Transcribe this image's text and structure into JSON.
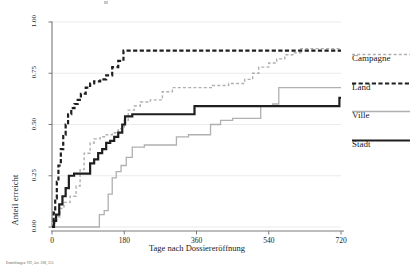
{
  "figure": {
    "footnote": "Ermittlungen VII, Art. 308, 315"
  },
  "chart_data": {
    "type": "line",
    "subtype": "step",
    "title": "",
    "xlabel": "Tage nach Dossiereröffnung",
    "ylabel": "Anteil erreicht",
    "xlim": [
      0,
      720
    ],
    "ylim": [
      0,
      1
    ],
    "xticks": [
      0,
      180,
      360,
      540,
      720
    ],
    "xticklabels": [
      "0",
      "180",
      "360",
      "540",
      "720"
    ],
    "yticks": [
      0.0,
      0.25,
      0.5,
      0.75,
      1.0
    ],
    "yticklabels": [
      "0.00",
      "0.25",
      "0.50",
      "0.75",
      "1.00"
    ],
    "grid": "horizontal",
    "legend_position": "right",
    "series": [
      {
        "name": "Campagne",
        "color": "#b0b0b0",
        "style": "dashed",
        "width": 1.4,
        "points": [
          [
            0,
            0.0
          ],
          [
            6,
            0.02
          ],
          [
            12,
            0.05
          ],
          [
            20,
            0.09
          ],
          [
            30,
            0.12
          ],
          [
            45,
            0.15
          ],
          [
            60,
            0.2
          ],
          [
            70,
            0.28
          ],
          [
            80,
            0.36
          ],
          [
            95,
            0.41
          ],
          [
            105,
            0.43
          ],
          [
            120,
            0.44
          ],
          [
            135,
            0.45
          ],
          [
            150,
            0.46
          ],
          [
            165,
            0.48
          ],
          [
            180,
            0.52
          ],
          [
            190,
            0.57
          ],
          [
            205,
            0.59
          ],
          [
            220,
            0.61
          ],
          [
            245,
            0.62
          ],
          [
            275,
            0.66
          ],
          [
            300,
            0.68
          ],
          [
            330,
            0.68
          ],
          [
            360,
            0.68
          ],
          [
            400,
            0.69
          ],
          [
            440,
            0.7
          ],
          [
            480,
            0.72
          ],
          [
            500,
            0.75
          ],
          [
            515,
            0.78
          ],
          [
            540,
            0.8
          ],
          [
            560,
            0.82
          ],
          [
            580,
            0.84
          ],
          [
            600,
            0.85
          ],
          [
            620,
            0.87
          ],
          [
            660,
            0.87
          ],
          [
            700,
            0.87
          ],
          [
            720,
            0.87
          ]
        ]
      },
      {
        "name": "Land",
        "color": "#1f1f1f",
        "style": "dashed",
        "width": 2.2,
        "points": [
          [
            0,
            0.0
          ],
          [
            4,
            0.07
          ],
          [
            8,
            0.14
          ],
          [
            12,
            0.22
          ],
          [
            16,
            0.3
          ],
          [
            22,
            0.38
          ],
          [
            28,
            0.45
          ],
          [
            34,
            0.5
          ],
          [
            40,
            0.55
          ],
          [
            48,
            0.58
          ],
          [
            56,
            0.6
          ],
          [
            64,
            0.62
          ],
          [
            72,
            0.65
          ],
          [
            84,
            0.68
          ],
          [
            95,
            0.7
          ],
          [
            105,
            0.71
          ],
          [
            120,
            0.72
          ],
          [
            135,
            0.74
          ],
          [
            150,
            0.78
          ],
          [
            165,
            0.81
          ],
          [
            178,
            0.86
          ],
          [
            200,
            0.86
          ],
          [
            260,
            0.86
          ],
          [
            320,
            0.86
          ],
          [
            380,
            0.86
          ],
          [
            440,
            0.86
          ],
          [
            500,
            0.86
          ],
          [
            560,
            0.86
          ],
          [
            620,
            0.86
          ],
          [
            680,
            0.86
          ],
          [
            720,
            0.86
          ]
        ]
      },
      {
        "name": "Ville",
        "color": "#b0b0b0",
        "style": "solid",
        "width": 1.3,
        "points": [
          [
            0,
            0.0
          ],
          [
            40,
            0.0
          ],
          [
            80,
            0.0
          ],
          [
            110,
            0.0
          ],
          [
            118,
            0.06
          ],
          [
            130,
            0.08
          ],
          [
            140,
            0.16
          ],
          [
            150,
            0.24
          ],
          [
            160,
            0.27
          ],
          [
            172,
            0.3
          ],
          [
            185,
            0.34
          ],
          [
            200,
            0.39
          ],
          [
            230,
            0.4
          ],
          [
            260,
            0.4
          ],
          [
            290,
            0.4
          ],
          [
            310,
            0.44
          ],
          [
            340,
            0.45
          ],
          [
            360,
            0.45
          ],
          [
            380,
            0.45
          ],
          [
            395,
            0.5
          ],
          [
            420,
            0.52
          ],
          [
            450,
            0.53
          ],
          [
            480,
            0.53
          ],
          [
            510,
            0.53
          ],
          [
            520,
            0.59
          ],
          [
            550,
            0.6
          ],
          [
            565,
            0.68
          ],
          [
            600,
            0.68
          ],
          [
            650,
            0.68
          ],
          [
            700,
            0.68
          ],
          [
            720,
            0.68
          ]
        ]
      },
      {
        "name": "Stadt",
        "color": "#1f1f1f",
        "style": "solid",
        "width": 2.2,
        "points": [
          [
            0,
            0.0
          ],
          [
            5,
            0.03
          ],
          [
            10,
            0.06
          ],
          [
            18,
            0.11
          ],
          [
            26,
            0.15
          ],
          [
            34,
            0.19
          ],
          [
            42,
            0.25
          ],
          [
            55,
            0.26
          ],
          [
            70,
            0.26
          ],
          [
            85,
            0.26
          ],
          [
            95,
            0.31
          ],
          [
            105,
            0.33
          ],
          [
            115,
            0.36
          ],
          [
            125,
            0.38
          ],
          [
            135,
            0.41
          ],
          [
            145,
            0.42
          ],
          [
            155,
            0.44
          ],
          [
            165,
            0.46
          ],
          [
            175,
            0.5
          ],
          [
            182,
            0.54
          ],
          [
            200,
            0.55
          ],
          [
            240,
            0.55
          ],
          [
            280,
            0.55
          ],
          [
            330,
            0.55
          ],
          [
            355,
            0.59
          ],
          [
            400,
            0.59
          ],
          [
            450,
            0.59
          ],
          [
            500,
            0.59
          ],
          [
            560,
            0.59
          ],
          [
            620,
            0.59
          ],
          [
            680,
            0.59
          ],
          [
            710,
            0.59
          ],
          [
            716,
            0.63
          ],
          [
            720,
            0.63
          ]
        ]
      }
    ]
  },
  "legend": {
    "entries": [
      {
        "label": "Campagne",
        "color": "#b0b0b0",
        "style": "dashed",
        "width": 1.4
      },
      {
        "label": "Land",
        "color": "#1f1f1f",
        "style": "dashed",
        "width": 2.2
      },
      {
        "label": "Ville",
        "color": "#b0b0b0",
        "style": "solid",
        "width": 1.3
      },
      {
        "label": "Stadt",
        "color": "#1f1f1f",
        "style": "solid",
        "width": 2.2
      }
    ]
  }
}
